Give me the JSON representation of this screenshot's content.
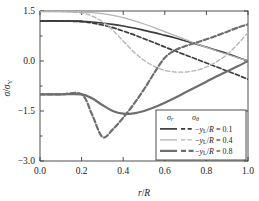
{
  "chart_data": {
    "type": "line",
    "title": "",
    "xlabel": "r/R",
    "ylabel": "sigma/sigma_Y",
    "xlabel_parts": {
      "italic1": "r",
      "slash": "/",
      "italic2": "R"
    },
    "ylabel_parts": {
      "sym": "σ",
      "slash": "/",
      "sym2": "σ",
      "sub": "Y"
    },
    "xlim": [
      0.0,
      1.0
    ],
    "ylim": [
      -3.0,
      1.5
    ],
    "xticks": [
      "0.0",
      "0.2",
      "0.4",
      "0.6",
      "0.8",
      "1.0"
    ],
    "xtick_values": [
      0.0,
      0.2,
      0.4,
      0.6,
      0.8,
      1.0
    ],
    "yticks": [
      "1.5",
      "0.0",
      "-1.5",
      "-3.0"
    ],
    "ytick_values": [
      1.5,
      0.0,
      -1.5,
      -3.0
    ],
    "grid": false,
    "legend_position": "lower-right",
    "legend": {
      "header_radial": "σ",
      "header_radial_sub": "r",
      "header_hoop": "σ",
      "header_hoop_sub": "θ",
      "entries": [
        {
          "label_prefix": "−",
          "label_sym": "y",
          "label_sub": "L",
          "label_rest": "/R = 0.1",
          "color": "#3c3c3c",
          "width": 1.7
        },
        {
          "label_prefix": "−",
          "label_sym": "y",
          "label_sub": "L",
          "label_rest": "/R = 0.4",
          "color": "#b4b4b4",
          "width": 1.3
        },
        {
          "label_prefix": "−",
          "label_sym": "y",
          "label_sub": "L",
          "label_rest": "/R = 0.8",
          "color": "#6e6e6e",
          "width": 2.2
        }
      ]
    },
    "series": [
      {
        "name": "sigma_r, -y_L/R = 0.1",
        "stress": "radial",
        "yL_over_R": 0.1,
        "style": "solid",
        "color": "#3c3c3c",
        "width": 1.7,
        "x": [
          0.0,
          0.1,
          0.2,
          0.25,
          0.3,
          0.35,
          0.4,
          0.45,
          0.5,
          0.55,
          0.6,
          0.65,
          0.7,
          0.75,
          0.8,
          0.85,
          0.9,
          0.95,
          1.0
        ],
        "y": [
          1.2,
          1.2,
          1.19,
          1.17,
          1.14,
          1.1,
          1.05,
          0.99,
          0.92,
          0.85,
          0.77,
          0.69,
          0.6,
          0.51,
          0.42,
          0.32,
          0.22,
          0.11,
          0.0
        ]
      },
      {
        "name": "sigma_theta, -y_L/R = 0.1",
        "stress": "hoop",
        "yL_over_R": 0.1,
        "style": "dashed",
        "color": "#3c3c3c",
        "width": 1.7,
        "x": [
          0.0,
          0.1,
          0.2,
          0.25,
          0.3,
          0.35,
          0.4,
          0.45,
          0.5,
          0.55,
          0.6,
          0.65,
          0.7,
          0.75,
          0.8,
          0.85,
          0.9,
          0.95,
          1.0
        ],
        "y": [
          1.2,
          1.2,
          1.18,
          1.14,
          1.08,
          1.0,
          0.9,
          0.79,
          0.67,
          0.55,
          0.42,
          0.3,
          0.18,
          0.06,
          -0.06,
          -0.18,
          -0.3,
          -0.42,
          -0.55
        ]
      },
      {
        "name": "sigma_r, -y_L/R = 0.4",
        "stress": "radial",
        "yL_over_R": 0.4,
        "style": "solid",
        "color": "#b4b4b4",
        "width": 1.3,
        "x": [
          0.0,
          0.1,
          0.2,
          0.25,
          0.3,
          0.35,
          0.4,
          0.45,
          0.5,
          0.55,
          0.6,
          0.65,
          0.7,
          0.75,
          0.8,
          0.85,
          0.9,
          0.95,
          1.0
        ],
        "y": [
          1.48,
          1.48,
          1.47,
          1.45,
          1.42,
          1.37,
          1.3,
          1.21,
          1.11,
          1.0,
          0.88,
          0.76,
          0.64,
          0.52,
          0.41,
          0.3,
          0.2,
          0.1,
          0.0
        ]
      },
      {
        "name": "sigma_theta, -y_L/R = 0.4",
        "stress": "hoop",
        "yL_over_R": 0.4,
        "style": "dashed",
        "color": "#b4b4b4",
        "width": 1.3,
        "x": [
          0.0,
          0.1,
          0.2,
          0.25,
          0.3,
          0.35,
          0.4,
          0.45,
          0.5,
          0.55,
          0.6,
          0.65,
          0.7,
          0.75,
          0.8,
          0.85,
          0.9,
          0.95,
          1.0
        ],
        "y": [
          1.48,
          1.48,
          1.44,
          1.35,
          1.18,
          0.92,
          0.6,
          0.28,
          0.02,
          -0.16,
          -0.28,
          -0.33,
          -0.33,
          -0.28,
          -0.18,
          -0.02,
          0.2,
          0.5,
          0.85
        ]
      },
      {
        "name": "sigma_r, -y_L/R = 0.8",
        "stress": "radial",
        "yL_over_R": 0.8,
        "style": "solid",
        "color": "#6e6e6e",
        "width": 2.2,
        "x": [
          0.0,
          0.1,
          0.2,
          0.25,
          0.3,
          0.35,
          0.4,
          0.45,
          0.5,
          0.55,
          0.6,
          0.65,
          0.7,
          0.75,
          0.8,
          0.85,
          0.9,
          0.95,
          1.0
        ],
        "y": [
          -1.0,
          -1.0,
          -1.0,
          -1.12,
          -1.32,
          -1.5,
          -1.58,
          -1.57,
          -1.5,
          -1.39,
          -1.25,
          -1.1,
          -0.94,
          -0.78,
          -0.62,
          -0.46,
          -0.31,
          -0.16,
          0.0
        ]
      },
      {
        "name": "sigma_theta, -y_L/R = 0.8",
        "stress": "hoop",
        "yL_over_R": 0.8,
        "style": "dashed",
        "color": "#6e6e6e",
        "width": 2.2,
        "x": [
          0.0,
          0.1,
          0.2,
          0.25,
          0.3,
          0.35,
          0.4,
          0.45,
          0.5,
          0.55,
          0.6,
          0.65,
          0.7,
          0.75,
          0.8,
          0.85,
          0.9,
          0.95,
          1.0
        ],
        "y": [
          -1.0,
          -1.0,
          -1.0,
          -1.6,
          -2.28,
          -2.05,
          -1.7,
          -1.3,
          -0.85,
          -0.35,
          0.1,
          0.32,
          0.45,
          0.55,
          0.65,
          0.76,
          0.88,
          1.0,
          1.1
        ]
      },
      {
        "name": "sigma_r upper-plateau, -y_L/R = 0.1 (top flat)",
        "stress": "radial",
        "yL_over_R": 0.1,
        "style": "solid",
        "color": "#3c3c3c",
        "width": 1.7,
        "x": [
          0.0,
          0.2
        ],
        "y": [
          1.2,
          1.2
        ]
      }
    ]
  }
}
